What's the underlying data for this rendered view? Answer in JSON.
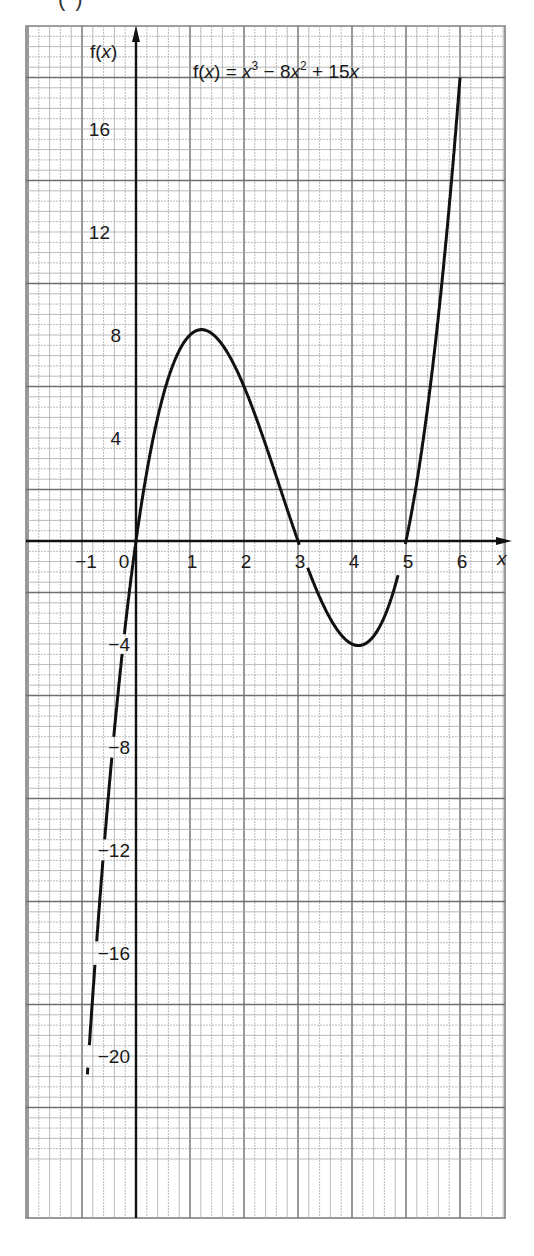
{
  "partial_label": "(",
  "chart_data": {
    "type": "line",
    "title_parts": [
      "f(",
      "x",
      ") = ",
      "x",
      "3",
      " − 8",
      "x",
      "2",
      " + 15",
      "x"
    ],
    "xlabel": "x",
    "ylabel": "f(x)",
    "xlim": [
      -2,
      6.8
    ],
    "ylim": [
      -26,
      20
    ],
    "grid": true,
    "grid_style": "graph paper, bold line every 1 x-unit and every 4 y-units",
    "x_ticks": [
      {
        "value": -1,
        "label": "−1"
      },
      {
        "value": 0,
        "label": "0"
      },
      {
        "value": 1,
        "label": "1"
      },
      {
        "value": 2,
        "label": "2"
      },
      {
        "value": 3,
        "label": "3"
      },
      {
        "value": 4,
        "label": "4"
      },
      {
        "value": 5,
        "label": "5"
      },
      {
        "value": 6,
        "label": "6"
      }
    ],
    "y_ticks": [
      {
        "value": 16,
        "label": "16"
      },
      {
        "value": 12,
        "label": "12"
      },
      {
        "value": 8,
        "label": "8"
      },
      {
        "value": 4,
        "label": "4"
      },
      {
        "value": -4,
        "label": "−4"
      },
      {
        "value": -8,
        "label": "−8"
      },
      {
        "value": -12,
        "label": "−12"
      },
      {
        "value": -16,
        "label": "−16"
      },
      {
        "value": -20,
        "label": "−20"
      }
    ],
    "series": [
      {
        "name": "f(x) = x^3 - 8x^2 + 15x",
        "x_range": [
          -0.9,
          6.0
        ],
        "x": [
          -0.9,
          -0.5,
          0,
          0.5,
          1,
          1.23,
          1.5,
          2,
          2.5,
          3,
          3.5,
          4,
          4.1,
          4.5,
          5,
          5.5,
          6
        ],
        "y": [
          -21.7,
          -9.6,
          0,
          5.6,
          8,
          8.2,
          7.9,
          6,
          3.1,
          0,
          -2.6,
          -4,
          -4.1,
          -3.4,
          0,
          6.9,
          18
        ]
      }
    ],
    "annotations": {
      "roots": [
        0,
        3,
        5
      ],
      "local_max": {
        "x": 1.23,
        "y": 8.2
      },
      "local_min": {
        "x": 4.1,
        "y": -4.1
      }
    }
  }
}
